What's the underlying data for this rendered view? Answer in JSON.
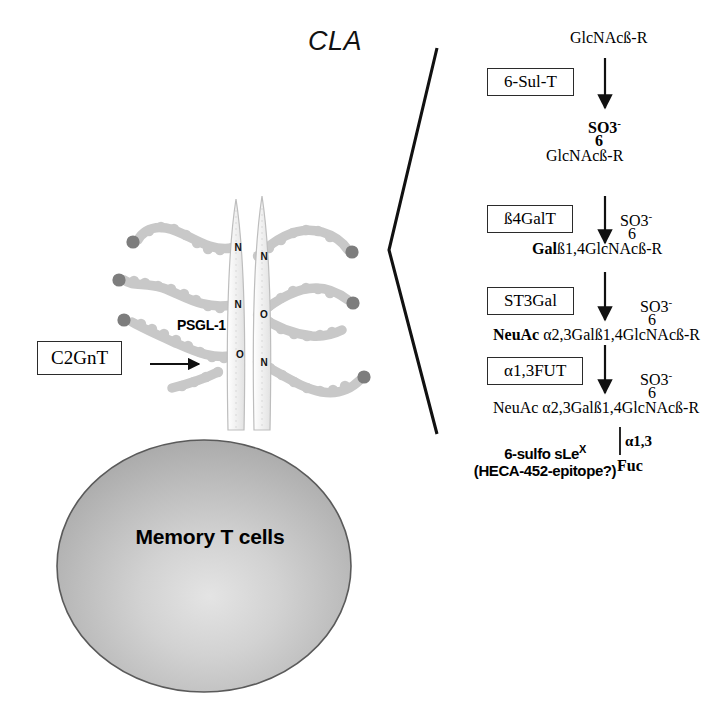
{
  "figure": {
    "title_cla": "CLA",
    "cell": {
      "label": "Memory T cells",
      "fill_color": "#b7b7b7",
      "edge_color": "#555555"
    },
    "receptor": {
      "label": "PSGL-1",
      "stalk_color": "#e9e9e9",
      "glycan_chain_color": "#c8c8c8",
      "glycan_terminal_color": "#7d7d7d",
      "attachment_sites_left": [
        "N",
        "N",
        "O"
      ],
      "attachment_sites_right": [
        "N",
        "O",
        "N"
      ]
    },
    "enzyme_annotation": {
      "label": "C2GnT",
      "points_to": "O-glycan core-2 branch point"
    }
  },
  "pathway": {
    "substrate": "GlcNAcß-R",
    "steps": [
      {
        "enzyme": "6-Sul-T",
        "sulfate": "SO3",
        "sulfate_charge": "-",
        "position": "6",
        "product_bold": "",
        "product_plain": "GlcNAcß-R",
        "sulfate_bold": true,
        "position_bold": true
      },
      {
        "enzyme": "ß4GalT",
        "sulfate": "SO3",
        "sulfate_charge": "-",
        "position": "6",
        "product_bold": "Gal",
        "product_plain": "ß1,4GlcNAcß-R",
        "sulfate_bold": false,
        "position_bold": false
      },
      {
        "enzyme": "ST3Gal",
        "sulfate": "SO3",
        "sulfate_charge": "-",
        "position": "6",
        "product_bold": "NeuAc",
        "product_plain": " α2,3Galß1,4GlcNAcß-R",
        "sulfate_bold": false,
        "position_bold": false
      },
      {
        "enzyme": "α1,3FUT",
        "sulfate": "SO3",
        "sulfate_charge": "-",
        "position": "6",
        "product_bold": "",
        "product_plain": "NeuAc α2,3Galß1,4GlcNAcß-R",
        "sulfate_bold": false,
        "position_bold": false
      }
    ],
    "branch": {
      "linkage": "α1,3",
      "residue": "Fuc"
    },
    "epitope": {
      "line1_prefix": "6-sulfo sLe",
      "line1_sup": "X",
      "line2": "(HECA-452-epitope?)"
    }
  }
}
